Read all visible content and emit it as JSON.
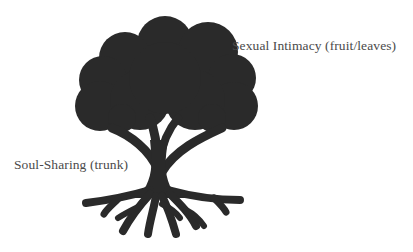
{
  "diagram": {
    "type": "labeled-illustration",
    "colors": {
      "tree": "#2a2a2a",
      "label_text": "#4a4a4a",
      "background": "#ffffff"
    },
    "labels": {
      "canopy": "Sexual Intimacy (fruit/leaves)",
      "trunk": "Soul-Sharing (trunk)"
    }
  }
}
